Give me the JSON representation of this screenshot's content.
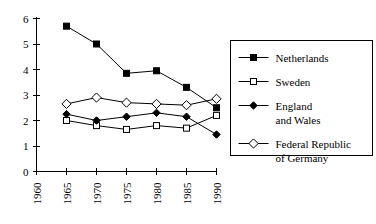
{
  "chart_data": {
    "type": "line",
    "title": "",
    "subtitle": "",
    "xlabel": "",
    "ylabel": "",
    "xlim": [
      1960,
      1990
    ],
    "ylim": [
      0,
      6
    ],
    "grid": false,
    "legend_position": "right",
    "x": [
      1965,
      1970,
      1975,
      1980,
      1985,
      1990
    ],
    "xticks": [
      "1960",
      "1965",
      "1970",
      "1975",
      "1980",
      "1985",
      "1990"
    ],
    "xtick_values": [
      1960,
      1965,
      1970,
      1975,
      1980,
      1985,
      1990
    ],
    "yticks": [
      "0",
      "1",
      "2",
      "3",
      "4",
      "5",
      "6"
    ],
    "ytick_values": [
      0,
      1,
      2,
      3,
      4,
      5,
      6
    ],
    "series": [
      {
        "name": "Netherlands",
        "marker": "filled-square",
        "values": [
          5.7,
          5.0,
          3.85,
          3.95,
          3.3,
          2.5
        ]
      },
      {
        "name": "Sweden",
        "marker": "open-square",
        "values": [
          2.0,
          1.8,
          1.65,
          1.8,
          1.7,
          2.2
        ]
      },
      {
        "name": "England and Wales",
        "marker": "filled-diamond",
        "values": [
          2.25,
          2.0,
          2.15,
          2.3,
          2.15,
          1.45
        ]
      },
      {
        "name": "Federal Republic of Germany",
        "marker": "open-diamond",
        "values": [
          2.65,
          2.9,
          2.7,
          2.65,
          2.6,
          2.85
        ]
      }
    ]
  },
  "legend": {
    "entries": [
      {
        "label_lines": [
          "Netherlands"
        ],
        "marker": "filled-square"
      },
      {
        "label_lines": [
          "Sweden"
        ],
        "marker": "open-square"
      },
      {
        "label_lines": [
          "England",
          "and Wales"
        ],
        "marker": "filled-diamond"
      },
      {
        "label_lines": [
          "Federal Republic",
          "of Germany"
        ],
        "marker": "open-diamond"
      }
    ]
  },
  "colors": {
    "axis": "#000000",
    "series": "#000000",
    "background": "#ffffff"
  }
}
